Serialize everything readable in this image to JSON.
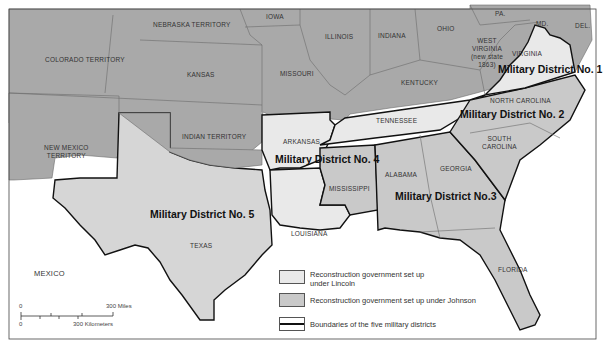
{
  "map": {
    "colors": {
      "lincoln": "#e9e9e9",
      "johnson": "#c9c9c9",
      "other": "#a9a9a9",
      "water": "#ffffff",
      "boundary": "#111111",
      "state_border": "#6b6b6b"
    },
    "labels": {
      "nebraska": "NEBRASKA TERRITORY",
      "iowa": "IOWA",
      "illinois": "ILLINOIS",
      "indiana": "INDIANA",
      "ohio": "OHIO",
      "pa": "PA.",
      "md": "MD.",
      "del": "DEL.",
      "colorado": "COLORADO TERRITORY",
      "kansas": "KANSAS",
      "missouri": "MISSOURI",
      "west_virginia_1": "WEST",
      "west_virginia_2": "VIRGINIA",
      "west_virginia_3": "(new state",
      "west_virginia_4": "1863)",
      "virginia": "VIRGINIA",
      "kentucky": "KENTUCKY",
      "north_carolina": "NORTH CAROLINA",
      "tennessee": "TENNESSEE",
      "indian_territory": "INDIAN TERRITORY",
      "arkansas": "ARKANSAS",
      "new_mexico_1": "NEW MEXICO",
      "new_mexico_2": "TERRITORY",
      "south_carolina_1": "SOUTH",
      "south_carolina_2": "CAROLINA",
      "mississippi": "MISSISSIPPI",
      "alabama": "ALABAMA",
      "georgia": "GEORGIA",
      "texas": "TEXAS",
      "louisiana": "LOUISIANA",
      "florida": "FLORIDA",
      "mexico": "MEXICO"
    },
    "districts": {
      "d1": "Military District No. 1",
      "d2": "Military District No. 2",
      "d3": "Military District No.3",
      "d4": "Military District No. 4",
      "d5": "Military District No. 5"
    },
    "legend": {
      "lincoln": "Reconstruction government set up under Lincoln",
      "johnson": "Reconstruction government set up under Johnson",
      "boundaries": "Boundaries of the five military districts"
    },
    "scale": {
      "zero_top": "0",
      "miles": "300 Miles",
      "zero_bottom": "0",
      "km": "300 Kilometers"
    }
  }
}
